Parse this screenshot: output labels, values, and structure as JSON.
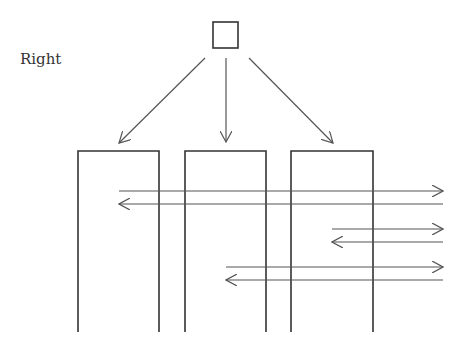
{
  "diagram": {
    "label": "Right",
    "colors": {
      "stroke": "#333333",
      "arrow": "#555555",
      "background": "#ffffff"
    },
    "root_square": {
      "x": 213,
      "y": 22,
      "w": 25,
      "h": 26
    },
    "columns": [
      {
        "id": "col-1",
        "x1": 78,
        "x2": 159,
        "top": 151,
        "bottom": 332
      },
      {
        "id": "col-2",
        "x1": 185,
        "x2": 266,
        "top": 151,
        "bottom": 332
      },
      {
        "id": "col-3",
        "x1": 291,
        "x2": 373,
        "top": 151,
        "bottom": 332
      }
    ],
    "tree_arrows": [
      {
        "from": [
          205,
          58
        ],
        "to": [
          119,
          143
        ]
      },
      {
        "from": [
          226,
          58
        ],
        "to": [
          226,
          142
        ]
      },
      {
        "from": [
          249,
          58
        ],
        "to": [
          333,
          143
        ]
      }
    ],
    "horizontal_arrows": [
      {
        "y": 191,
        "from": 119,
        "to": 443
      },
      {
        "y": 204,
        "from": 443,
        "to": 119
      },
      {
        "y": 229,
        "from": 332,
        "to": 443
      },
      {
        "y": 242,
        "from": 443,
        "to": 332
      },
      {
        "y": 267,
        "from": 226,
        "to": 443
      },
      {
        "y": 280,
        "from": 443,
        "to": 226
      }
    ]
  }
}
